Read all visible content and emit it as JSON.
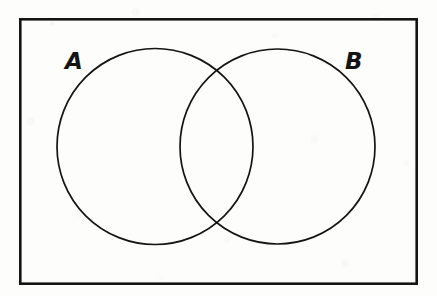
{
  "figure": {
    "kind": "venn-diagram",
    "background_color": "#fdfdfb",
    "ink_color": "#141414"
  },
  "universal_set_box": {
    "name": "universal-set-rectangle",
    "x": 19,
    "y": 18,
    "width": 399,
    "height": 267,
    "stroke_width": 2.6,
    "stroke_color": "#141414",
    "fill": "none"
  },
  "circles": [
    {
      "label": "A",
      "name": "set-a-circle",
      "cx": 155,
      "cy": 146.5,
      "r": 98,
      "stroke_width": 1.7,
      "stroke_color": "#141414",
      "fill": "none"
    },
    {
      "label": "B",
      "name": "set-b-circle",
      "cx": 277.5,
      "cy": 146.5,
      "r": 97.5,
      "stroke_width": 1.7,
      "stroke_color": "#141414",
      "fill": "none"
    }
  ],
  "labels": {
    "set_a": "A",
    "set_b": "B"
  },
  "intersection_points": [
    {
      "x": 213,
      "y": 75
    },
    {
      "x": 213,
      "y": 218
    }
  ]
}
